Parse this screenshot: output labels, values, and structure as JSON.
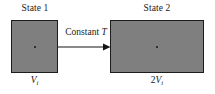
{
  "diagram": {
    "type": "thermodynamic-process-diagram",
    "colors": {
      "gas_fill": "#7f7f7f",
      "border": "#1c1c1c",
      "text": "#1a1a1a",
      "background": "#ffffff"
    },
    "states": [
      {
        "id": "state1",
        "title": "State 1",
        "volume_label": "V",
        "volume_subscript": "i",
        "volume_coefficient": "",
        "box": {
          "x": 11,
          "y": 20,
          "width": 47,
          "height": 53
        }
      },
      {
        "id": "state2",
        "title": "State 2",
        "volume_label": "V",
        "volume_subscript": "i",
        "volume_coefficient": "2",
        "box": {
          "x": 110,
          "y": 20,
          "width": 94,
          "height": 53
        }
      }
    ],
    "process": {
      "label_prefix": "Constant ",
      "label_symbol": "T",
      "arrow_direction": "right"
    }
  }
}
